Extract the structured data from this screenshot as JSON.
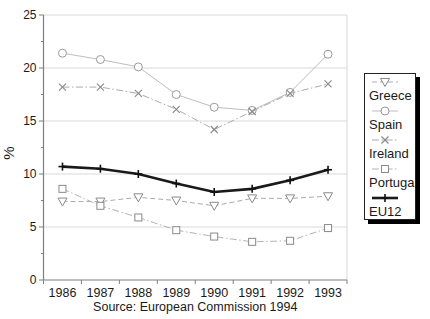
{
  "figure": {
    "ylabel": "%",
    "source": "Source: European Commission 1994"
  },
  "chart_data": {
    "type": "line",
    "title": "",
    "xlabel": "",
    "ylabel": "%",
    "categories": [
      "1986",
      "1987",
      "1988",
      "1989",
      "1990",
      "1991",
      "1992",
      "1993"
    ],
    "series": [
      {
        "name": "Greece",
        "marker": "triangle-down",
        "line": "dashed",
        "color": "#ababab",
        "marker_color": "#8a8a8a",
        "width": 1,
        "values": [
          7.4,
          7.4,
          7.8,
          7.5,
          7.0,
          7.7,
          7.7,
          7.9
        ]
      },
      {
        "name": "Spain",
        "marker": "circle",
        "line": "solid",
        "color": "#bdbdbd",
        "marker_color": "#9a9a9a",
        "width": 1,
        "values": [
          21.4,
          20.8,
          20.1,
          17.5,
          16.3,
          16.0,
          17.7,
          21.3
        ]
      },
      {
        "name": "Ireland",
        "marker": "x",
        "line": "dashdot",
        "color": "#ababab",
        "marker_color": "#8a8a8a",
        "width": 1,
        "values": [
          18.2,
          18.2,
          17.6,
          16.1,
          14.2,
          15.9,
          17.6,
          18.5
        ]
      },
      {
        "name": "Portugal",
        "marker": "square",
        "line": "dashdot",
        "color": "#b3b3b3",
        "marker_color": "#8a8a8a",
        "width": 1,
        "values": [
          8.6,
          7.0,
          5.9,
          4.7,
          4.1,
          3.6,
          3.7,
          4.9
        ]
      },
      {
        "name": "EU12",
        "marker": "plus",
        "line": "solid",
        "color": "#1a1a1a",
        "marker_color": "#111111",
        "width": 2.6,
        "values": [
          10.7,
          10.5,
          10.0,
          9.1,
          8.3,
          8.6,
          9.4,
          10.4
        ]
      }
    ],
    "yticks": [
      0,
      5,
      10,
      15,
      20,
      25
    ],
    "yticks_minor": [
      2.5,
      7.5,
      12.5,
      17.5,
      22.5
    ],
    "ylim": [
      0,
      25
    ],
    "grid": true,
    "legend_position": "right",
    "source": "Source: European Commission 1994",
    "colors": {
      "gridline": "#d9d9d9",
      "axis": "#7f7f7f",
      "text": "#1a1a1a",
      "background": "#ffffff",
      "legend_shadow": "#000000"
    }
  }
}
